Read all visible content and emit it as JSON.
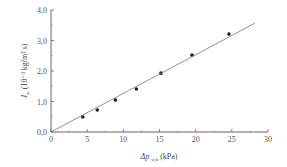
{
  "chart_data": {
    "type": "scatter",
    "title": "",
    "xlabel": "Δp w,b (kPa)",
    "xlabel_main": "Δp",
    "xlabel_sub": "w,b",
    "xlabel_unit": "(kPa)",
    "ylabel": "Jw (10⁻³ kg/m² s)",
    "ylabel_main": "J",
    "ylabel_sub": "w",
    "ylabel_unit": "(10⁻³ kg/m² s)",
    "xlim": [
      0,
      30
    ],
    "ylim": [
      0,
      4.0
    ],
    "x_ticks": [
      "0",
      "5",
      "10",
      "15",
      "20",
      "25",
      "30"
    ],
    "y_ticks": [
      "0,0",
      "1,0",
      "2,0",
      "3,0",
      "4,0"
    ],
    "grid": false,
    "legend": null,
    "series": [
      {
        "name": "measured",
        "marker": "circle",
        "x": [
          4.4,
          6.4,
          8.9,
          11.8,
          15.2,
          19.5,
          24.6
        ],
        "y": [
          0.49,
          0.72,
          1.05,
          1.41,
          1.93,
          2.52,
          3.21
        ]
      },
      {
        "name": "linear fit",
        "marker": "line",
        "x": [
          0,
          28.2
        ],
        "y": [
          0,
          3.57
        ]
      }
    ]
  }
}
